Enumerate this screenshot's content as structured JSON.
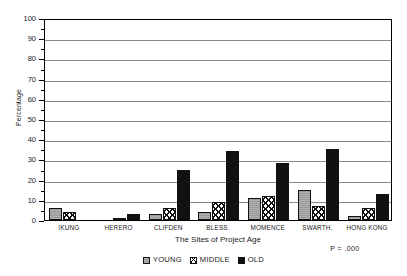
{
  "chart_data": {
    "type": "bar",
    "title": "",
    "xlabel": "The Sites of Project Age",
    "ylabel": "Percentage",
    "ylim": [
      0,
      100
    ],
    "ytick_step": 10,
    "yticks": [
      "0",
      "10",
      "20",
      "30",
      "40",
      "50",
      "60",
      "70",
      "80",
      "90",
      "100"
    ],
    "grid": true,
    "legend_position": "bottom-center",
    "categories": [
      "!KUNG",
      "HERERO",
      "CLIFDEN",
      "BLESS.",
      "MOMENCE",
      "SWARTH.",
      "HONG KONG"
    ],
    "series": [
      {
        "name": "YOUNG",
        "values": [
          6,
          0,
          3,
          4,
          11,
          15,
          2
        ]
      },
      {
        "name": "MIDDLE",
        "values": [
          4,
          1,
          6,
          9,
          12,
          7,
          6
        ]
      },
      {
        "name": "OLD",
        "values": [
          0,
          3,
          25,
          34,
          28,
          35,
          13
        ]
      }
    ],
    "annotation": "P = .000"
  },
  "legend": {
    "items": [
      {
        "label": "YOUNG",
        "pattern": "solid-gray",
        "color": "#9a9a9a"
      },
      {
        "label": "MIDDLE",
        "pattern": "crosshatch",
        "color": "#ffffff"
      },
      {
        "label": "OLD",
        "pattern": "solid-black",
        "color": "#111111"
      }
    ]
  },
  "colors": {
    "young": "#9a9a9a",
    "middle": "#ffffff",
    "old": "#111111",
    "axis": "#000000",
    "grid": "#8a8a8a",
    "background": "#ffffff",
    "text": "#1a1a1a"
  }
}
